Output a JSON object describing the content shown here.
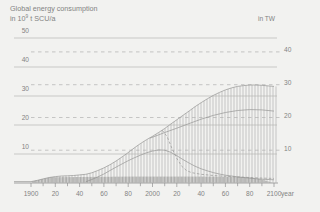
{
  "header": {
    "title": "Global energy consumption",
    "subtitle_prefix": "in 10",
    "subtitle_exponent": "9",
    "subtitle_suffix": " t SCU/a",
    "right_unit_label": "in TW"
  },
  "colors": {
    "background": "#f2f2f0",
    "text": "#838383",
    "grid_solid": "#b7b7b6",
    "grid_dashed": "#b1b1b0",
    "hatch": "#b3b3b2",
    "dense_hatch": "#8f8f8e",
    "curve": "#9b9b9a",
    "axis": "#919190"
  },
  "chart_data": {
    "type": "area",
    "title": "Global energy consumption",
    "xlabel": "year",
    "ylabel_left": "10⁹ t SCU/a",
    "ylabel_right": "TW",
    "x_range": [
      1900,
      2100
    ],
    "x_minor_tick_step": 10,
    "x_labeled_ticks": [
      [
        1900,
        "1900"
      ],
      [
        1920,
        "20"
      ],
      [
        1940,
        "40"
      ],
      [
        1960,
        "60"
      ],
      [
        1980,
        "80"
      ],
      [
        2000,
        "2000"
      ],
      [
        2020,
        "20"
      ],
      [
        2040,
        "40"
      ],
      [
        2060,
        "60"
      ],
      [
        2080,
        "80"
      ],
      [
        2100,
        "2100"
      ]
    ],
    "y_left_ticks": [
      10,
      20,
      30,
      40,
      50
    ],
    "y_right_ticks": [
      10,
      20,
      30,
      40
    ],
    "tw_to_left_units": 1.13,
    "grid": "horizontal-only",
    "legend": "none",
    "series": [
      {
        "name": "total-energy-consumption",
        "style": "hatch-area",
        "points": [
          [
            1900,
            0.5
          ],
          [
            1905,
            0.9
          ],
          [
            1910,
            1.4
          ],
          [
            1915,
            1.9
          ],
          [
            1920,
            2.2
          ],
          [
            1925,
            2.4
          ],
          [
            1930,
            2.5
          ],
          [
            1935,
            2.6
          ],
          [
            1940,
            2.8
          ],
          [
            1945,
            3.0
          ],
          [
            1950,
            3.5
          ],
          [
            1955,
            4.3
          ],
          [
            1960,
            5.2
          ],
          [
            1965,
            6.3
          ],
          [
            1970,
            7.6
          ],
          [
            1975,
            9.0
          ],
          [
            1980,
            10.5
          ],
          [
            1985,
            12.1
          ],
          [
            1990,
            13.6
          ],
          [
            1995,
            14.9
          ],
          [
            2000,
            16.1
          ],
          [
            2005,
            17.4
          ],
          [
            2010,
            18.8
          ],
          [
            2015,
            20.3
          ],
          [
            2020,
            21.8
          ],
          [
            2025,
            23.3
          ],
          [
            2030,
            24.8
          ],
          [
            2035,
            26.3
          ],
          [
            2040,
            27.7
          ],
          [
            2045,
            29.0
          ],
          [
            2050,
            30.2
          ],
          [
            2055,
            31.2
          ],
          [
            2060,
            32.1
          ],
          [
            2065,
            32.8
          ],
          [
            2070,
            33.3
          ],
          [
            2075,
            33.6
          ],
          [
            2080,
            33.8
          ],
          [
            2085,
            33.8
          ],
          [
            2090,
            33.7
          ],
          [
            2095,
            33.5
          ],
          [
            2100,
            33.3
          ]
        ]
      },
      {
        "name": "secondary-projection",
        "style": "line",
        "points": [
          [
            1998,
            15.5
          ],
          [
            2005,
            16.6
          ],
          [
            2010,
            17.4
          ],
          [
            2020,
            18.9
          ],
          [
            2030,
            20.5
          ],
          [
            2040,
            22.0
          ],
          [
            2050,
            23.3
          ],
          [
            2060,
            24.3
          ],
          [
            2070,
            25.0
          ],
          [
            2080,
            25.3
          ],
          [
            2090,
            25.2
          ],
          [
            2100,
            24.8
          ]
        ]
      },
      {
        "name": "peaking-fossil-curve",
        "style": "line",
        "points": [
          [
            1945,
            0.4
          ],
          [
            1950,
            1.2
          ],
          [
            1955,
            2.1
          ],
          [
            1960,
            3.1
          ],
          [
            1965,
            4.3
          ],
          [
            1970,
            5.5
          ],
          [
            1975,
            6.6
          ],
          [
            1980,
            7.7
          ],
          [
            1985,
            8.7
          ],
          [
            1990,
            9.6
          ],
          [
            1995,
            10.4
          ],
          [
            2000,
            11.0
          ],
          [
            2005,
            11.4
          ],
          [
            2010,
            11.3
          ],
          [
            2015,
            10.6
          ],
          [
            2020,
            9.4
          ],
          [
            2025,
            8.1
          ],
          [
            2030,
            6.9
          ],
          [
            2035,
            5.8
          ],
          [
            2040,
            4.9
          ],
          [
            2045,
            4.2
          ],
          [
            2050,
            3.6
          ],
          [
            2055,
            3.1
          ],
          [
            2060,
            2.7
          ],
          [
            2065,
            2.4
          ],
          [
            2070,
            2.1
          ],
          [
            2075,
            1.9
          ],
          [
            2080,
            1.7
          ],
          [
            2085,
            1.5
          ],
          [
            2090,
            1.3
          ],
          [
            2095,
            1.2
          ],
          [
            2100,
            1.1
          ]
        ]
      },
      {
        "name": "declining-share-dashed",
        "style": "dashed-line",
        "points": [
          [
            2008,
            18.2
          ],
          [
            2012,
            16.0
          ],
          [
            2016,
            12.0
          ],
          [
            2020,
            8.5
          ],
          [
            2024,
            5.8
          ],
          [
            2028,
            4.3
          ],
          [
            2032,
            3.6
          ],
          [
            2040,
            3.0
          ],
          [
            2050,
            2.6
          ],
          [
            2060,
            2.3
          ],
          [
            2070,
            2.1
          ],
          [
            2080,
            1.9
          ],
          [
            2090,
            1.7
          ],
          [
            2100,
            1.6
          ]
        ]
      },
      {
        "name": "base-band",
        "style": "dense-hatch",
        "points": [
          [
            1900,
            1.9
          ],
          [
            1920,
            2.0
          ],
          [
            1950,
            2.1
          ],
          [
            1980,
            2.2
          ],
          [
            2000,
            2.2
          ],
          [
            2040,
            2.2
          ],
          [
            2070,
            2.1
          ],
          [
            2080,
            1.9
          ],
          [
            2088,
            1.4
          ],
          [
            2094,
            0.7
          ],
          [
            2098,
            0.2
          ]
        ]
      }
    ]
  }
}
